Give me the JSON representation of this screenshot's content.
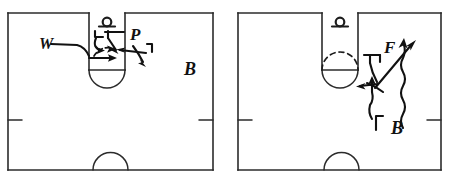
{
  "figure": {
    "type": "hand-drawn-tactics-diagram",
    "panel_count": 2,
    "ink_color": "#111111",
    "line_color": "#2b2b2b",
    "background": "#ffffff"
  },
  "panels": [
    {
      "id": "left-panel",
      "name": "left-court-diagram",
      "court": {
        "name": "handball-court-half",
        "goal_area_shape": "solid-semicircle",
        "center_arc": "bottom-semicircle",
        "side_tick_marks": 2
      },
      "labels": [
        {
          "key": "w",
          "text": "W",
          "role": "player-marker-w"
        },
        {
          "key": "p",
          "text": "P",
          "role": "player-marker-p"
        },
        {
          "key": "b",
          "text": "B",
          "role": "player-marker-b"
        }
      ],
      "annotations": {
        "arrows": 4,
        "hook_marks": 2,
        "dashed_arrows": 1
      }
    },
    {
      "id": "right-panel",
      "name": "right-court-diagram",
      "court": {
        "name": "handball-court-half",
        "goal_area_shape": "circle-with-dashed-upper-arc",
        "center_arc": "bottom-semicircle",
        "side_tick_marks": 2
      },
      "labels": [
        {
          "key": "f",
          "text": "F",
          "role": "player-marker-f"
        },
        {
          "key": "b",
          "text": "B",
          "role": "player-marker-b"
        }
      ],
      "annotations": {
        "arrows": 3,
        "hook_marks": 2,
        "wavy_arrows": 1
      }
    }
  ]
}
